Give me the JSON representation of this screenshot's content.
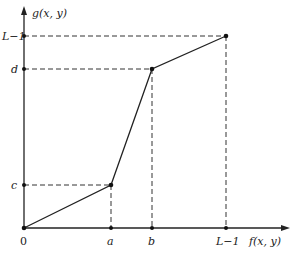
{
  "diagram": {
    "type": "piecewise-linear contrast stretching transform",
    "x_axis_label": "f(x, y)",
    "y_axis_label": "g(x, y)",
    "origin_label": "0",
    "x_ticks": [
      "a",
      "b",
      "L−1"
    ],
    "y_ticks": [
      "c",
      "d",
      "L−1"
    ],
    "points": [
      {
        "x": "0",
        "y": "0"
      },
      {
        "x": "a",
        "y": "c"
      },
      {
        "x": "b",
        "y": "d"
      },
      {
        "x": "L−1",
        "y": "L−1"
      }
    ],
    "line_color": "#222222",
    "dash_color": "#333333"
  }
}
